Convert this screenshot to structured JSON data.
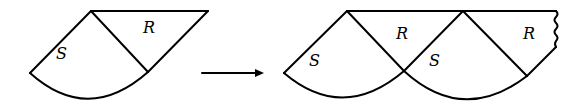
{
  "diagram": {
    "left_figure": {
      "regions": [
        {
          "id": "S",
          "label": "S",
          "x": 63,
          "y": 55
        },
        {
          "id": "R",
          "label": "R",
          "x": 148,
          "y": 27
        }
      ]
    },
    "arrow": {
      "label": ""
    },
    "right_figure": {
      "regions": [
        {
          "id": "S1",
          "label": "S",
          "x": 315,
          "y": 53
        },
        {
          "id": "R1",
          "label": "R",
          "x": 401,
          "y": 27
        },
        {
          "id": "S2",
          "label": "S",
          "x": 434,
          "y": 53
        },
        {
          "id": "R2",
          "label": "R",
          "x": 528,
          "y": 27
        }
      ],
      "continuation": "wavy-edge"
    },
    "colors": {
      "stroke": "#000000",
      "background": "#ffffff"
    }
  }
}
